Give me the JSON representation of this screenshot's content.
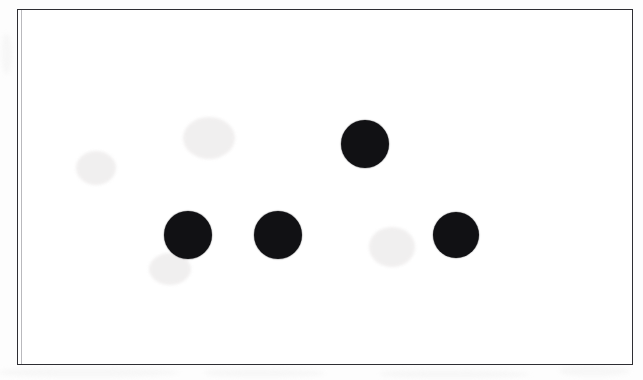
{
  "figure": {
    "caption": "",
    "background_color": "#ffffff",
    "outside_color": "#fdfdfd",
    "border_color": "#2e2e33",
    "dot_color": "#111114",
    "frame": {
      "x": 17,
      "y": 9,
      "width": 616,
      "height": 356,
      "border_width": 1.4
    }
  },
  "chart_data": {
    "type": "scatter",
    "title": "",
    "subtitle": "",
    "xlabel": "",
    "ylabel": "",
    "grid": false,
    "legend": "none",
    "axis_visible": false,
    "tick_labels": [],
    "marker": {
      "shape": "circle",
      "color": "#111114",
      "filled": true
    },
    "xlim": [
      17,
      633
    ],
    "ylim": [
      365,
      9
    ],
    "units": "pixels",
    "n_points": 4,
    "series": [
      {
        "name": "dots",
        "points": [
          {
            "label": "top",
            "x": 364,
            "y": 143,
            "diameter": 48
          },
          {
            "label": "bottom-left",
            "x": 187,
            "y": 234,
            "diameter": 48
          },
          {
            "label": "bottom-middle",
            "x": 277,
            "y": 234,
            "diameter": 48
          },
          {
            "label": "bottom-right",
            "x": 455,
            "y": 234,
            "diameter": 46
          }
        ]
      }
    ]
  },
  "artifacts": {
    "smudges": [
      {
        "x": 182,
        "y": 116,
        "width": 52,
        "height": 42
      },
      {
        "x": 75,
        "y": 150,
        "width": 40,
        "height": 34
      },
      {
        "x": 368,
        "y": 226,
        "width": 46,
        "height": 40
      },
      {
        "x": 148,
        "y": 252,
        "width": 42,
        "height": 32
      }
    ],
    "paper_marks": [
      {
        "x": 0,
        "y": 368,
        "width": 180,
        "height": 9
      },
      {
        "x": 205,
        "y": 369,
        "width": 120,
        "height": 8
      },
      {
        "x": 380,
        "y": 370,
        "width": 150,
        "height": 8
      },
      {
        "x": 560,
        "y": 366,
        "width": 70,
        "height": 10
      },
      {
        "x": 2,
        "y": 34,
        "width": 10,
        "height": 40
      }
    ]
  }
}
